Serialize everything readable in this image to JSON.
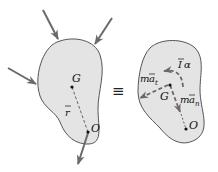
{
  "diagram": {
    "type": "free-body-kinetic-equivalence",
    "left_body": {
      "point_g_label": "G",
      "point_o_label": "O",
      "r_label": "r",
      "r_overbar": true,
      "force_count": 4
    },
    "equivalence_symbol": "≡",
    "right_body": {
      "point_g_label": "G",
      "point_o_label": "O",
      "moment_label_base": "I",
      "moment_label_overbar": true,
      "moment_label_alpha": "α",
      "tangential_label_m": "m",
      "tangential_label_a": "a",
      "tangential_subscript": "t",
      "normal_label_m": "m",
      "normal_label_a": "a",
      "normal_subscript": "n"
    },
    "colors": {
      "body_fill": "#e4e4e4",
      "body_stroke": "#555555",
      "arrow": "#6a6a6a",
      "text": "#111111"
    }
  }
}
